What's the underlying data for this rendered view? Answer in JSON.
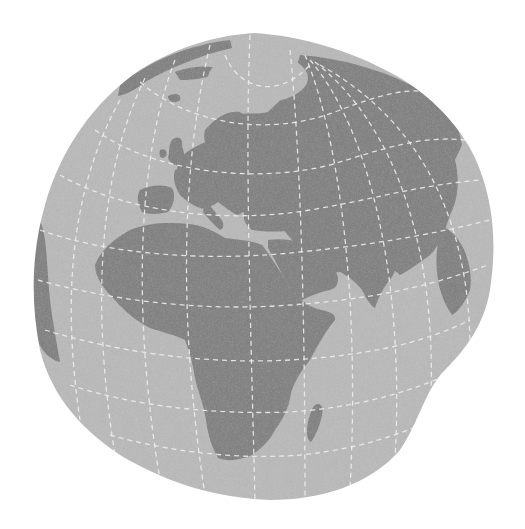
{
  "map": {
    "title": "",
    "projection": "distorted-orthographic-globe",
    "center_region": "Europe / Africa / Middle East",
    "visible_regions": [
      "Europe",
      "Africa",
      "Arabian Peninsula",
      "Asia",
      "Greenland (edge)",
      "South America (edge)",
      "Madagascar",
      "Scandinavia",
      "British Isles",
      "Indian subcontinent",
      "Southeast Asia (edge)"
    ],
    "colors": {
      "background": "#ffffff",
      "ocean": "#b9b9b9",
      "land": "#7b7b7b",
      "graticule": "#f4f4f4",
      "polar_cap": "#b9b9b9"
    },
    "graticule": {
      "style": "dashed",
      "visible": true
    }
  }
}
